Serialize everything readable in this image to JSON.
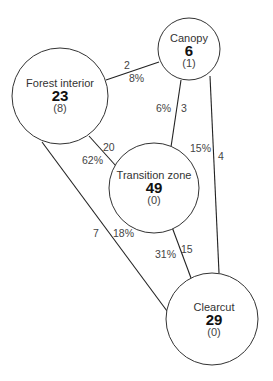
{
  "diagram": {
    "nodes": {
      "canopy": {
        "title": "Canopy",
        "value": "6",
        "sub": "(1)"
      },
      "forest_interior": {
        "title": "Forest interior",
        "value": "23",
        "sub": "(8)"
      },
      "transition_zone": {
        "title": "Transition zone",
        "value": "49",
        "sub": "(0)"
      },
      "clearcut": {
        "title": "Clearcut",
        "value": "29",
        "sub": "(0)"
      }
    },
    "edges": {
      "forest_canopy": {
        "from": "Forest interior",
        "to": "Canopy",
        "count": "2",
        "percent": "8%"
      },
      "canopy_transition": {
        "from": "Canopy",
        "to": "Transition zone",
        "count": "3",
        "percent": "6%"
      },
      "canopy_clearcut": {
        "from": "Canopy",
        "to": "Clearcut",
        "count": "4",
        "percent": "15%"
      },
      "forest_transition": {
        "from": "Forest interior",
        "to": "Transition zone",
        "count": "20",
        "percent": "62%"
      },
      "forest_clearcut": {
        "from": "Forest interior",
        "to": "Clearcut",
        "count": "7",
        "percent": "18%"
      },
      "transition_clearcut": {
        "from": "Transition zone",
        "to": "Clearcut",
        "count": "15",
        "percent": "31%"
      }
    }
  }
}
